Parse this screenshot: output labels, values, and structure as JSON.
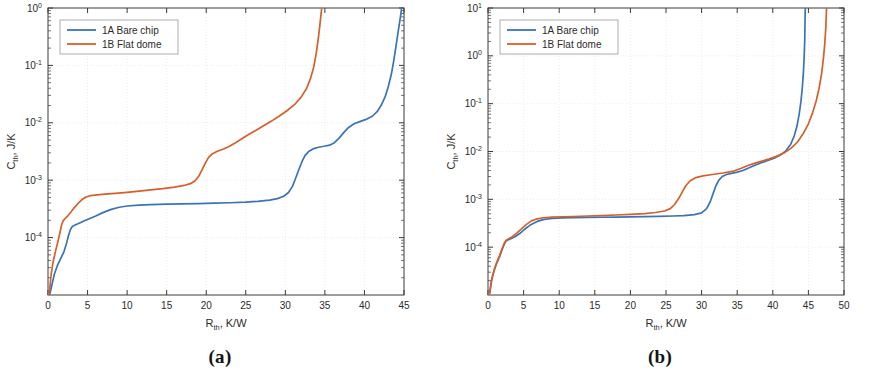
{
  "figure": {
    "panels": [
      {
        "caption": "(a)",
        "name": "panel-a"
      },
      {
        "caption": "(b)",
        "name": "panel-b"
      }
    ]
  },
  "chart_data": [
    {
      "type": "line",
      "panel": "(a)",
      "title": "",
      "xlabel": "R",
      "xlabel_sub": "th",
      "xlabel_unit": ", K/W",
      "ylabel": "C",
      "ylabel_sub": "th",
      "ylabel_unit": ", J/K",
      "xlim": [
        0,
        45
      ],
      "ylim": [
        1e-05,
        1
      ],
      "yscale": "log",
      "xscale": "linear",
      "xticks": [
        0,
        5,
        10,
        15,
        20,
        25,
        30,
        35,
        40,
        45
      ],
      "yticks": [
        0.0001,
        0.001,
        0.01,
        0.1,
        1
      ],
      "ytick_labels": [
        "10-4",
        "10-3",
        "10-2",
        "10-1",
        "100"
      ],
      "ytick_mantissa": [
        "10",
        "10",
        "10",
        "10",
        "10"
      ],
      "ytick_exponent": [
        "-4",
        "-3",
        "-2",
        "-1",
        "0"
      ],
      "grid": true,
      "legend_position": "upper left",
      "series": [
        {
          "name": "1A Bare chip",
          "color": "#3A73B8",
          "points": [
            [
              0.05,
              3e-06
            ],
            [
              0.2,
              7.5e-06
            ],
            [
              0.45,
              1.4e-05
            ],
            [
              0.8,
              2.3e-05
            ],
            [
              1.2,
              3.3e-05
            ],
            [
              1.6,
              4.3e-05
            ],
            [
              2.0,
              5.6e-05
            ],
            [
              2.35,
              8e-05
            ],
            [
              2.6,
              0.00011
            ],
            [
              2.85,
              0.00014
            ],
            [
              3.1,
              0.000158
            ],
            [
              3.5,
              0.000168
            ],
            [
              4.0,
              0.00018
            ],
            [
              4.6,
              0.000196
            ],
            [
              5.3,
              0.000215
            ],
            [
              6.1,
              0.00024
            ],
            [
              7.0,
              0.000275
            ],
            [
              8.0,
              0.00031
            ],
            [
              9.0,
              0.000338
            ],
            [
              10.0,
              0.000355
            ],
            [
              11.5,
              0.000368
            ],
            [
              13.0,
              0.000375
            ],
            [
              15.0,
              0.000382
            ],
            [
              17.0,
              0.000387
            ],
            [
              19.0,
              0.000392
            ],
            [
              21.0,
              0.000398
            ],
            [
              23.0,
              0.000405
            ],
            [
              25.0,
              0.000415
            ],
            [
              26.5,
              0.000428
            ],
            [
              28.0,
              0.00045
            ],
            [
              29.0,
              0.000478
            ],
            [
              29.8,
              0.000525
            ],
            [
              30.4,
              0.00061
            ],
            [
              30.9,
              0.00078
            ],
            [
              31.3,
              0.00108
            ],
            [
              31.7,
              0.00152
            ],
            [
              32.1,
              0.0021
            ],
            [
              32.5,
              0.0027
            ],
            [
              33.0,
              0.0032
            ],
            [
              33.6,
              0.00355
            ],
            [
              34.2,
              0.00375
            ],
            [
              34.9,
              0.0039
            ],
            [
              35.6,
              0.00408
            ],
            [
              36.2,
              0.0045
            ],
            [
              36.8,
              0.0054
            ],
            [
              37.4,
              0.0068
            ],
            [
              38.0,
              0.0083
            ],
            [
              38.7,
              0.0096
            ],
            [
              39.5,
              0.0106
            ],
            [
              40.3,
              0.0116
            ],
            [
              41.0,
              0.013
            ],
            [
              41.6,
              0.0156
            ],
            [
              42.1,
              0.02
            ],
            [
              42.6,
              0.028
            ],
            [
              43.0,
              0.042
            ],
            [
              43.4,
              0.07
            ],
            [
              43.7,
              0.12
            ],
            [
              44.0,
              0.22
            ],
            [
              44.3,
              0.42
            ],
            [
              44.55,
              0.7
            ],
            [
              44.7,
              1.0
            ]
          ]
        },
        {
          "name": "1B Flat dome",
          "color": "#D4602A",
          "points": [
            [
              0.05,
              4.5e-06
            ],
            [
              0.2,
              1.2e-05
            ],
            [
              0.4,
              2.3e-05
            ],
            [
              0.65,
              3.8e-05
            ],
            [
              0.95,
              5.8e-05
            ],
            [
              1.25,
              8.5e-05
            ],
            [
              1.5,
              0.00012
            ],
            [
              1.7,
              0.000162
            ],
            [
              1.9,
              0.000195
            ],
            [
              2.15,
              0.000215
            ],
            [
              2.5,
              0.00024
            ],
            [
              2.9,
              0.00028
            ],
            [
              3.3,
              0.00033
            ],
            [
              3.8,
              0.000395
            ],
            [
              4.3,
              0.00046
            ],
            [
              4.8,
              0.00051
            ],
            [
              5.4,
              0.00054
            ],
            [
              6.2,
              0.000555
            ],
            [
              7.2,
              0.00057
            ],
            [
              8.5,
              0.00059
            ],
            [
              10.0,
              0.000615
            ],
            [
              11.5,
              0.000645
            ],
            [
              13.0,
              0.00068
            ],
            [
              14.5,
              0.000715
            ],
            [
              16.0,
              0.00076
            ],
            [
              17.2,
              0.00081
            ],
            [
              18.0,
              0.00087
            ],
            [
              18.6,
              0.00098
            ],
            [
              19.1,
              0.0012
            ],
            [
              19.5,
              0.00155
            ],
            [
              19.9,
              0.002
            ],
            [
              20.3,
              0.0025
            ],
            [
              20.8,
              0.0029
            ],
            [
              21.4,
              0.0032
            ],
            [
              22.2,
              0.0035
            ],
            [
              23.0,
              0.00395
            ],
            [
              23.8,
              0.0046
            ],
            [
              24.6,
              0.0054
            ],
            [
              25.4,
              0.0063
            ],
            [
              26.3,
              0.0074
            ],
            [
              27.2,
              0.0088
            ],
            [
              28.2,
              0.0106
            ],
            [
              29.2,
              0.013
            ],
            [
              30.2,
              0.0162
            ],
            [
              31.2,
              0.021
            ],
            [
              32.0,
              0.028
            ],
            [
              32.7,
              0.04
            ],
            [
              33.2,
              0.06
            ],
            [
              33.6,
              0.095
            ],
            [
              33.9,
              0.16
            ],
            [
              34.15,
              0.28
            ],
            [
              34.35,
              0.48
            ],
            [
              34.5,
              0.75
            ],
            [
              34.6,
              1.0
            ]
          ]
        }
      ]
    },
    {
      "type": "line",
      "panel": "(b)",
      "title": "",
      "xlabel": "R",
      "xlabel_sub": "th",
      "xlabel_unit": ", K/W",
      "ylabel": "C",
      "ylabel_sub": "th",
      "ylabel_unit": ", J/K",
      "xlim": [
        0,
        50
      ],
      "ylim": [
        1e-05,
        10
      ],
      "yscale": "log",
      "xscale": "linear",
      "xticks": [
        0,
        5,
        10,
        15,
        20,
        25,
        30,
        35,
        40,
        45,
        50
      ],
      "yticks": [
        0.0001,
        0.001,
        0.01,
        0.1,
        1,
        10
      ],
      "ytick_mantissa": [
        "10",
        "10",
        "10",
        "10",
        "10",
        "10"
      ],
      "ytick_exponent": [
        "-4",
        "-3",
        "-2",
        "-1",
        "0",
        "1"
      ],
      "grid": true,
      "legend_position": "upper left",
      "series": [
        {
          "name": "1A Bare chip",
          "color": "#3A73B8",
          "points": [
            [
              0.05,
              4e-06
            ],
            [
              0.25,
              1.1e-05
            ],
            [
              0.5,
              2e-05
            ],
            [
              0.85,
              3.2e-05
            ],
            [
              1.2,
              4.5e-05
            ],
            [
              1.6,
              6.2e-05
            ],
            [
              1.95,
              8.6e-05
            ],
            [
              2.25,
              0.000112
            ],
            [
              2.5,
              0.000132
            ],
            [
              2.8,
              0.000142
            ],
            [
              3.2,
              0.00015
            ],
            [
              3.8,
              0.000165
            ],
            [
              4.5,
              0.000195
            ],
            [
              5.2,
              0.00024
            ],
            [
              6.0,
              0.000295
            ],
            [
              6.9,
              0.000345
            ],
            [
              7.9,
              0.00038
            ],
            [
              9.0,
              0.000398
            ],
            [
              10.5,
              0.000408
            ],
            [
              12.0,
              0.000412
            ],
            [
              14.0,
              0.000418
            ],
            [
              16.0,
              0.000422
            ],
            [
              18.0,
              0.000426
            ],
            [
              20.0,
              0.00043
            ],
            [
              22.0,
              0.000434
            ],
            [
              24.0,
              0.00044
            ],
            [
              26.0,
              0.000448
            ],
            [
              27.5,
              0.000458
            ],
            [
              29.0,
              0.000478
            ],
            [
              30.0,
              0.00052
            ],
            [
              30.7,
              0.00064
            ],
            [
              31.2,
              0.00088
            ],
            [
              31.6,
              0.0013
            ],
            [
              32.0,
              0.0019
            ],
            [
              32.4,
              0.0025
            ],
            [
              32.9,
              0.003
            ],
            [
              33.5,
              0.0033
            ],
            [
              34.2,
              0.0035
            ],
            [
              35.0,
              0.0037
            ],
            [
              35.8,
              0.004
            ],
            [
              36.6,
              0.0045
            ],
            [
              37.4,
              0.0051
            ],
            [
              38.2,
              0.0057
            ],
            [
              39.2,
              0.0064
            ],
            [
              40.2,
              0.0072
            ],
            [
              41.0,
              0.0083
            ],
            [
              41.8,
              0.0102
            ],
            [
              42.5,
              0.014
            ],
            [
              43.0,
              0.021
            ],
            [
              43.4,
              0.034
            ],
            [
              43.7,
              0.06
            ],
            [
              43.95,
              0.11
            ],
            [
              44.15,
              0.22
            ],
            [
              44.3,
              0.45
            ],
            [
              44.4,
              0.9
            ],
            [
              44.48,
              2.0
            ],
            [
              44.52,
              4.5
            ],
            [
              44.56,
              10.0
            ]
          ]
        },
        {
          "name": "1B Flat dome",
          "color": "#D4602A",
          "points": [
            [
              0.05,
              4.2e-06
            ],
            [
              0.25,
              1.15e-05
            ],
            [
              0.5,
              2.1e-05
            ],
            [
              0.85,
              3.3e-05
            ],
            [
              1.2,
              4.7e-05
            ],
            [
              1.6,
              6.5e-05
            ],
            [
              1.95,
              9e-05
            ],
            [
              2.25,
              0.000118
            ],
            [
              2.55,
              0.00014
            ],
            [
              2.9,
              0.00015
            ],
            [
              3.4,
              0.000165
            ],
            [
              4.0,
              0.000195
            ],
            [
              4.7,
              0.00024
            ],
            [
              5.4,
              0.0003
            ],
            [
              6.1,
              0.000355
            ],
            [
              6.9,
              0.000392
            ],
            [
              7.8,
              0.000412
            ],
            [
              9.0,
              0.000424
            ],
            [
              10.5,
              0.000432
            ],
            [
              12.0,
              0.000438
            ],
            [
              14.0,
              0.000448
            ],
            [
              16.0,
              0.000458
            ],
            [
              18.0,
              0.00047
            ],
            [
              20.0,
              0.000485
            ],
            [
              22.0,
              0.000505
            ],
            [
              23.5,
              0.00053
            ],
            [
              24.8,
              0.00057
            ],
            [
              25.6,
              0.00064
            ],
            [
              26.2,
              0.00078
            ],
            [
              26.8,
              0.00105
            ],
            [
              27.3,
              0.00145
            ],
            [
              27.8,
              0.00195
            ],
            [
              28.4,
              0.00245
            ],
            [
              29.2,
              0.00285
            ],
            [
              30.2,
              0.0031
            ],
            [
              31.5,
              0.0033
            ],
            [
              33.0,
              0.00355
            ],
            [
              34.5,
              0.0039
            ],
            [
              35.5,
              0.0044
            ],
            [
              36.5,
              0.0051
            ],
            [
              37.5,
              0.0057
            ],
            [
              38.5,
              0.0063
            ],
            [
              39.5,
              0.007
            ],
            [
              40.5,
              0.0079
            ],
            [
              41.5,
              0.0092
            ],
            [
              42.5,
              0.0115
            ],
            [
              43.5,
              0.016
            ],
            [
              44.3,
              0.024
            ],
            [
              45.0,
              0.038
            ],
            [
              45.6,
              0.065
            ],
            [
              46.1,
              0.115
            ],
            [
              46.5,
              0.21
            ],
            [
              46.85,
              0.42
            ],
            [
              47.1,
              0.85
            ],
            [
              47.3,
              1.8
            ],
            [
              47.45,
              4.0
            ],
            [
              47.55,
              10.0
            ]
          ]
        }
      ]
    }
  ]
}
